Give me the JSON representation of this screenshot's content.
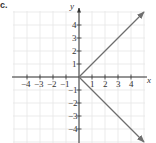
{
  "part_label": "c.",
  "chart_data": {
    "type": "line",
    "title": "",
    "xlabel": "x",
    "ylabel": "y",
    "xlim": [
      -5,
      5
    ],
    "ylim": [
      -5,
      5
    ],
    "grid": true,
    "x_ticks": [
      -4,
      -3,
      -2,
      -1,
      1,
      2,
      3,
      4
    ],
    "y_ticks": [
      4,
      3,
      2,
      1,
      -1,
      -2,
      -3,
      -4
    ],
    "x_tick_labels": [
      "−4",
      "−3",
      "−2",
      "−1",
      "1",
      "2",
      "3",
      "4"
    ],
    "y_tick_labels": [
      "4",
      "3",
      "2",
      "1",
      "−1",
      "−2",
      "−3",
      "−4"
    ],
    "series": [
      {
        "name": "upper ray",
        "points": [
          [
            0,
            0
          ],
          [
            5,
            5
          ]
        ],
        "arrow_end": true
      },
      {
        "name": "lower ray",
        "points": [
          [
            0,
            0
          ],
          [
            5,
            -5
          ]
        ],
        "arrow_end": true
      }
    ],
    "relation": "x = |y|",
    "colors": {
      "grid": "#e6e6e6",
      "axis": "#333333",
      "curve": "#6e6e6e"
    }
  }
}
